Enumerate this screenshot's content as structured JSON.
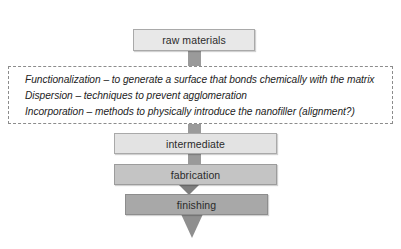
{
  "diagram": {
    "colors": {
      "box_raw_fill": "#e8e8e8",
      "box_intermediate_fill": "#e3e3e3",
      "box_fabrication_fill": "#c4c4c4",
      "box_finishing_fill": "#a8a8a8",
      "connector_fill": "#9a9a9a",
      "arrow_fill": "#8f8f8f",
      "border": "#a9a9a9",
      "note_border": "#8c8c8c",
      "text": "#232323",
      "background": "#ffffff"
    },
    "nodes": [
      {
        "id": "raw",
        "label": "raw materials"
      },
      {
        "id": "intermediate",
        "label": "intermediate"
      },
      {
        "id": "fabrication",
        "label": "fabrication"
      },
      {
        "id": "finishing",
        "label": "finishing"
      }
    ],
    "note": {
      "lines": [
        "Functionalization – to generate a surface that bonds chemically with the matrix",
        "Dispersion – techniques to prevent agglomeration",
        "Incorporation – methods to physically introduce the nanofiller (alignment?)"
      ]
    },
    "connectors": [
      {
        "id": "raw-to-note",
        "type": "bar"
      },
      {
        "id": "note-to-int",
        "type": "bar"
      },
      {
        "id": "int-to-fab",
        "type": "bar"
      },
      {
        "id": "fab-to-fin",
        "type": "arrow"
      },
      {
        "id": "fin-out",
        "type": "arrow"
      }
    ]
  }
}
